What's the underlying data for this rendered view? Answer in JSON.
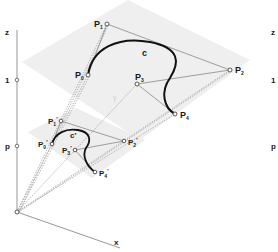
{
  "figure": {
    "axes": {
      "z_label": "z",
      "x_label": "x",
      "tick_one": "1",
      "tick_p": "p",
      "hidden_axis_label": "y"
    },
    "upper_plane": {
      "curve_label": "c",
      "points": [
        {
          "name": "P",
          "sub": "0",
          "x": 88,
          "y": 75
        },
        {
          "name": "P",
          "sub": "1",
          "x": 107,
          "y": 24
        },
        {
          "name": "P",
          "sub": "2",
          "x": 230,
          "y": 70
        },
        {
          "name": "P",
          "sub": "3",
          "x": 137,
          "y": 84
        },
        {
          "name": "P",
          "sub": "4",
          "x": 175,
          "y": 114
        }
      ]
    },
    "lower_plane": {
      "curve_label": "c'",
      "points": [
        {
          "name": "P",
          "sub": "0",
          "prime": "'",
          "x": 52,
          "y": 144
        },
        {
          "name": "P",
          "sub": "1",
          "prime": "'",
          "x": 61,
          "y": 121
        },
        {
          "name": "P",
          "sub": "2",
          "prime": "'",
          "x": 124,
          "y": 141
        },
        {
          "name": "P",
          "sub": "3",
          "prime": "'",
          "x": 75,
          "y": 150
        },
        {
          "name": "P",
          "sub": "4",
          "prime": "'",
          "x": 95,
          "y": 172
        }
      ]
    },
    "right_ghost_labels": {
      "z": "z",
      "one": "1",
      "p": "p"
    },
    "colors": {
      "plane": "#efefef",
      "curve": "#111111",
      "polygon": "#777777",
      "axis": "#888888",
      "rays": "#999999"
    }
  }
}
